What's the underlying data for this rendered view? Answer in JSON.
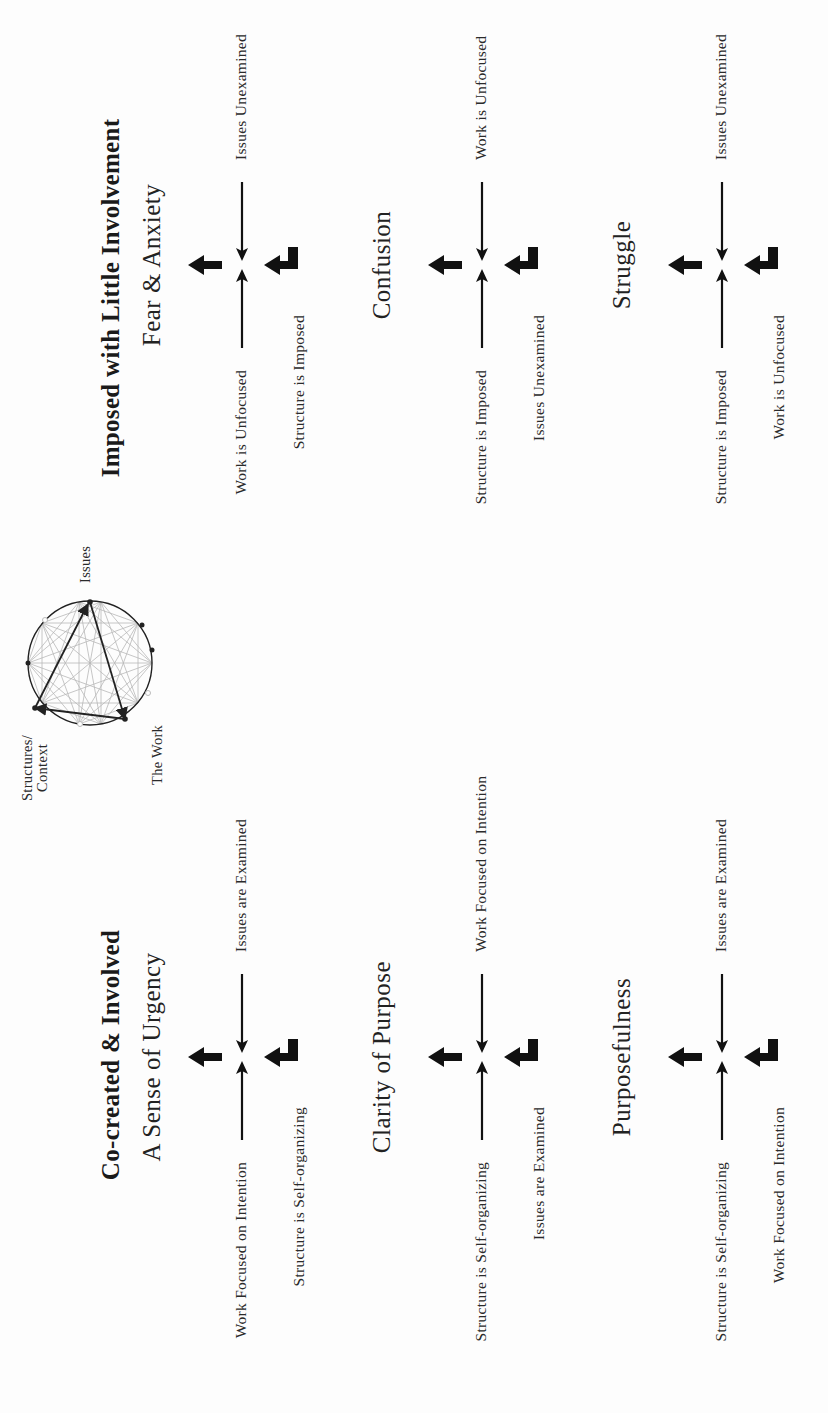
{
  "colors": {
    "ink": "#111111",
    "background": "#fdfdfd",
    "diagram_faint": "#b8b8b8"
  },
  "diagram": {
    "labels": {
      "issues": "Issues",
      "structures": "Structures/",
      "structures_line2": "Context",
      "work": "The Work"
    }
  },
  "sections": [
    {
      "title": "Co-created & Involved",
      "blocks": [
        {
          "state": "A Sense of Urgency",
          "left_label": "Work Focused on Intention",
          "right_label": "Issues are Examined",
          "bottom_label": "Structure is Self-organizing"
        },
        {
          "state": "Clarity of Purpose",
          "left_label": "Structure is Self-organizing",
          "right_label": "Work Focused on Intention",
          "bottom_label": "Issues are Examined"
        },
        {
          "state": "Purposefulness",
          "left_label": "Structure is Self-organizing",
          "right_label": "Issues are Examined",
          "bottom_label": "Work Focused on Intention"
        }
      ]
    },
    {
      "title": "Imposed with Little Involvement",
      "blocks": [
        {
          "state": "Fear & Anxiety",
          "left_label": "Work is Unfocused",
          "right_label": "Issues Unexamined",
          "bottom_label": "Structure is Imposed"
        },
        {
          "state": "Confusion",
          "left_label": "Structure is Imposed",
          "right_label": "Work is Unfocused",
          "bottom_label": "Issues Unexamined"
        },
        {
          "state": "Struggle",
          "left_label": "Structure is Imposed",
          "right_label": "Issues Unexamined",
          "bottom_label": "Work is Unfocused"
        }
      ]
    }
  ]
}
